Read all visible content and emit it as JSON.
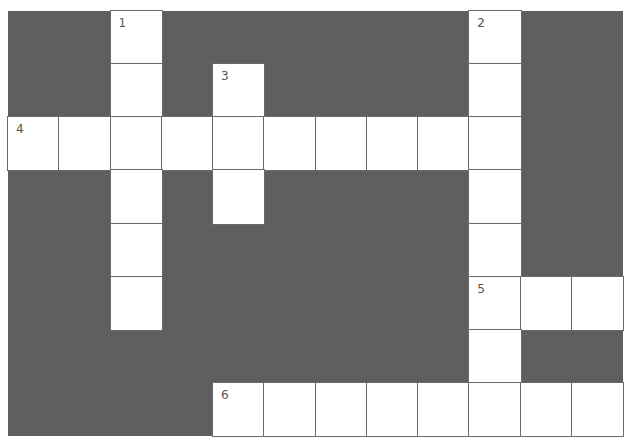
{
  "puzzle": {
    "rows": 8,
    "cols": 12,
    "colors": {
      "block": "#5f5f5f",
      "cell": "#ffffff",
      "line": "#6a6a6a"
    },
    "layout": [
      "..1......2..",
      "..#.3....#..",
      "4########x..",
      "..#.#....#..",
      "..#......#..",
      "..#......5##",
      ".........#..",
      "....6#######"
    ],
    "numbers": [
      {
        "n": "1",
        "row": 0,
        "col": 2,
        "direction": "down",
        "length": 6
      },
      {
        "n": "2",
        "row": 0,
        "col": 9,
        "direction": "down",
        "length": 7
      },
      {
        "n": "3",
        "row": 1,
        "col": 4,
        "direction": "down",
        "length": 3
      },
      {
        "n": "4",
        "row": 2,
        "col": 0,
        "direction": "across",
        "length": 10
      },
      {
        "n": "5",
        "row": 5,
        "col": 9,
        "direction": "across",
        "length": 3
      },
      {
        "n": "6",
        "row": 7,
        "col": 4,
        "direction": "across",
        "length": 8
      }
    ]
  }
}
